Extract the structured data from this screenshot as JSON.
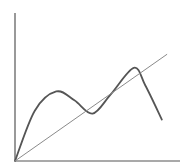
{
  "chart_data": {
    "type": "line",
    "title": "",
    "xlabel": "",
    "ylabel": "",
    "xlim": [
      0,
      100
    ],
    "ylim": [
      0,
      100
    ],
    "grid": false,
    "legend": null,
    "series": [
      {
        "name": "curve",
        "style": "smooth",
        "color": "#555555",
        "width": 1.8,
        "points": [
          [
            0,
            0
          ],
          [
            12,
            34
          ],
          [
            25,
            47
          ],
          [
            36,
            41
          ],
          [
            47,
            32
          ],
          [
            58,
            45
          ],
          [
            72,
            63
          ],
          [
            79,
            51
          ],
          [
            89,
            28
          ]
        ]
      },
      {
        "name": "line",
        "style": "straight",
        "color": "#8a8a8a",
        "width": 1,
        "points": [
          [
            0,
            0
          ],
          [
            92,
            72
          ]
        ]
      }
    ]
  },
  "layout": {
    "origin_px": [
      15,
      161
    ],
    "x_axis_end_px": 180,
    "y_axis_top_px": 13,
    "axis_color": "#555555"
  }
}
